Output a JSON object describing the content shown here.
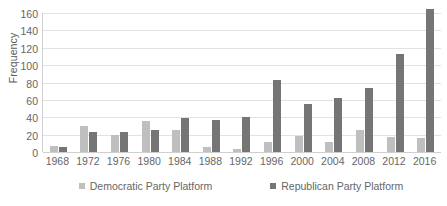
{
  "chart_data": {
    "type": "bar",
    "title": "",
    "xlabel": "",
    "ylabel": "Frequency",
    "ylim": [
      0,
      160
    ],
    "ytick_step": 20,
    "yticks": [
      160,
      140,
      120,
      100,
      80,
      60,
      40,
      20,
      0
    ],
    "grid": true,
    "legend_position": "bottom",
    "categories": [
      "1968",
      "1972",
      "1976",
      "1980",
      "1984",
      "1988",
      "1992",
      "1996",
      "2000",
      "2004",
      "2008",
      "2012",
      "2016"
    ],
    "series": [
      {
        "name": "Democratic Party Platform",
        "color": "#bfbfbf",
        "values": [
          7,
          30,
          20,
          36,
          25,
          6,
          3,
          11,
          19,
          12,
          25,
          17,
          16
        ]
      },
      {
        "name": "Republican Party Platform",
        "color": "#757575",
        "values": [
          6,
          23,
          23,
          25,
          39,
          37,
          40,
          83,
          55,
          62,
          74,
          113,
          165
        ]
      }
    ]
  },
  "legend": {
    "items": [
      {
        "label": "Democratic Party Platform",
        "swatch": "dem"
      },
      {
        "label": "Republican Party Platform",
        "swatch": "rep"
      }
    ]
  }
}
